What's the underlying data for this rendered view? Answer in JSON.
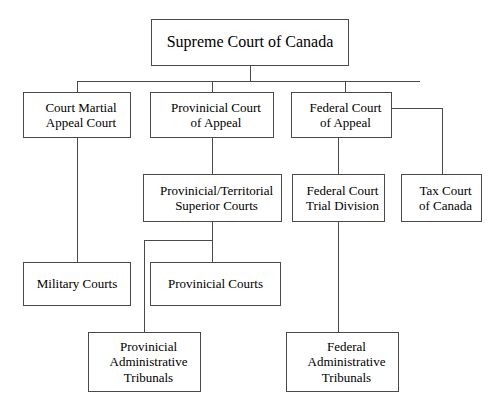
{
  "diagram": {
    "title": "Supreme Court of Canada",
    "type": "hierarchy",
    "background_color": "#ffffff",
    "border_color": "#4a4a4a",
    "text_color": "#000000",
    "nodes": {
      "supreme_court": "Supreme Court of Canada",
      "court_martial_appeal_l1": "Court Martial",
      "court_martial_appeal_l2": "Appeal Court",
      "provincial_court_appeal_l1": "Provinicial Court",
      "provincial_court_appeal_l2": "of Appeal",
      "federal_court_appeal_l1": "Federal Court",
      "federal_court_appeal_l2": "of Appeal",
      "superior_courts_l1": "Provinicial/Territorial",
      "superior_courts_l2": "Superior Courts",
      "federal_trial_division_l1": "Federal Court",
      "federal_trial_division_l2": "Trial Division",
      "tax_court_l1": "Tax Court",
      "tax_court_l2": "of Canada",
      "military_courts": "Military Courts",
      "provincial_courts": "Provinicial Courts",
      "provincial_tribunals_l1": "Provinicial",
      "provincial_tribunals_l2": "Administrative",
      "provincial_tribunals_l3": "Tribunals",
      "federal_tribunals_l1": "Federal",
      "federal_tribunals_l2": "Administrative",
      "federal_tribunals_l3": "Tribunals"
    }
  }
}
